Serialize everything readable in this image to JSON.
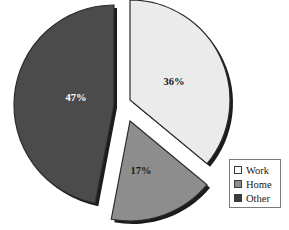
{
  "chart_data": {
    "type": "pie",
    "title": "",
    "subtitle": "",
    "labels": [
      "Work",
      "Home",
      "Other"
    ],
    "values": [
      36,
      17,
      47
    ],
    "value_labels": [
      "36%",
      "17%",
      "47%"
    ],
    "units": "percent",
    "total": 100,
    "colors": [
      "#ebebeb",
      "#8d8d8d",
      "#4b4b4b"
    ],
    "edge_color": "#2a2a2a",
    "shadow_color": "#1c1c1c",
    "label_text_colors": [
      "#1a1a1a",
      "#1a1a1a",
      "#ffffff"
    ],
    "exploded": true,
    "start_angle_deg": 0,
    "direction": "clockwise",
    "legend": {
      "position": "bottom-right",
      "border_color": "#7a7a7a",
      "background": "#ffffff",
      "entries": [
        {
          "label": "Work",
          "color": "#fbfbfb"
        },
        {
          "label": "Home",
          "color": "#8d8d8d"
        },
        {
          "label": "Other",
          "color": "#3d3d3d"
        }
      ]
    },
    "background": "#ffffff",
    "grid": false,
    "xlabel": "",
    "ylabel": ""
  },
  "slices": [
    {
      "name": "Work",
      "percent_text": "36%",
      "start_deg": 0,
      "end_deg": 129.6,
      "explode_x": 12,
      "explode_y": -5,
      "label_x": 174,
      "label_y": 85,
      "fill": "#ebebeb",
      "text_color": "#1a1a1a"
    },
    {
      "name": "Home",
      "percent_text": "17%",
      "start_deg": 129.6,
      "end_deg": 190.8,
      "explode_x": 12,
      "explode_y": 16,
      "label_x": 141,
      "label_y": 174,
      "fill": "#8d8d8d",
      "text_color": "#1a1a1a"
    },
    {
      "name": "Other",
      "percent_text": "47%",
      "start_deg": 190.8,
      "end_deg": 360,
      "explode_x": -4,
      "explode_y": 0,
      "label_x": 76,
      "label_y": 101,
      "fill": "#4b4b4b",
      "text_color": "#ffffff"
    }
  ],
  "geometry": {
    "cx": 118,
    "cy": 105,
    "radius": 100,
    "shadow_offset_x": 3,
    "shadow_offset_y": 3
  }
}
